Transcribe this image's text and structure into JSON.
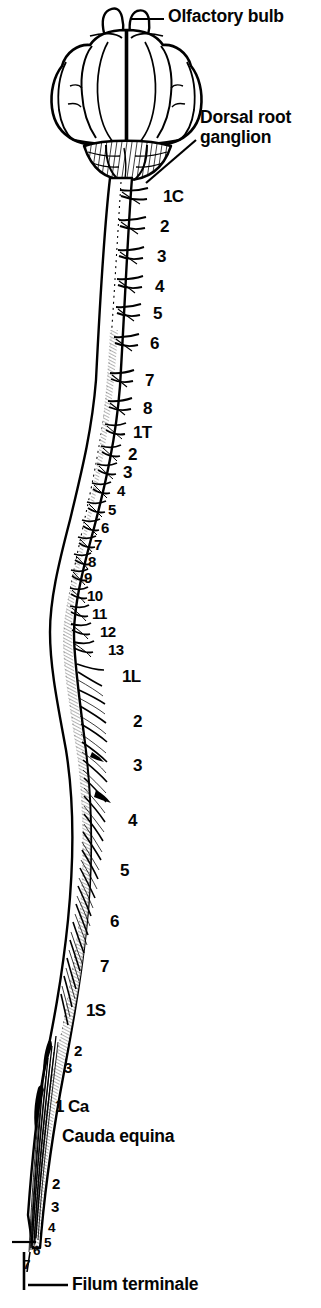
{
  "figure": {
    "background_color": "#ffffff",
    "ink_color": "#000000"
  },
  "callouts": [
    {
      "name": "olfactory-bulb",
      "text": "Olfactory bulb",
      "lines": [
        "Olfactory bulb"
      ],
      "x": 168,
      "y": 8,
      "leader": true
    },
    {
      "name": "dorsal-root-ganglion",
      "text": "Dorsal root ganglion",
      "lines": [
        "Dorsal root",
        "ganglion"
      ],
      "x": 200,
      "y": 108,
      "leader": true
    },
    {
      "name": "cauda-equina",
      "text": "Cauda equina",
      "lines": [
        "Cauda equina"
      ],
      "x": 62,
      "y": 1128,
      "leader": false
    },
    {
      "name": "filum-terminale",
      "text": "Filum terminale",
      "lines": [
        "Filum terminale"
      ],
      "x": 72,
      "y": 1276,
      "leader": true
    }
  ],
  "segments": {
    "cervical": {
      "region": "cervical",
      "region_code": "C",
      "count": 8,
      "labels": [
        "1C",
        "2",
        "3",
        "4",
        "5",
        "6",
        "7",
        "8"
      ],
      "positions": [
        {
          "label": "1C",
          "x": 163,
          "y": 188
        },
        {
          "label": "2",
          "x": 160,
          "y": 218
        },
        {
          "label": "3",
          "x": 157,
          "y": 248
        },
        {
          "label": "4",
          "x": 155,
          "y": 278
        },
        {
          "label": "5",
          "x": 153,
          "y": 305
        },
        {
          "label": "6",
          "x": 150,
          "y": 335
        },
        {
          "label": "7",
          "x": 145,
          "y": 372
        },
        {
          "label": "8",
          "x": 143,
          "y": 400
        }
      ]
    },
    "thoracic": {
      "region": "thoracic",
      "region_code": "T",
      "count": 13,
      "labels": [
        "1T",
        "2",
        "3",
        "4",
        "5",
        "6",
        "7",
        "8",
        "9",
        "10",
        "11",
        "12",
        "13"
      ],
      "positions": [
        {
          "label": "1T",
          "x": 133,
          "y": 424
        },
        {
          "label": "2",
          "x": 128,
          "y": 446
        },
        {
          "label": "3",
          "x": 123,
          "y": 464
        },
        {
          "label": "4",
          "x": 117,
          "y": 483
        },
        {
          "label": "5",
          "x": 108,
          "y": 502
        },
        {
          "label": "6",
          "x": 101,
          "y": 520
        },
        {
          "label": "7",
          "x": 94,
          "y": 537
        },
        {
          "label": "8",
          "x": 88,
          "y": 554
        },
        {
          "label": "9",
          "x": 84,
          "y": 570
        },
        {
          "label": "10",
          "x": 87,
          "y": 588
        },
        {
          "label": "11",
          "x": 92,
          "y": 606
        },
        {
          "label": "12",
          "x": 100,
          "y": 624
        },
        {
          "label": "13",
          "x": 108,
          "y": 642
        }
      ]
    },
    "lumbar": {
      "region": "lumbar",
      "region_code": "L",
      "count": 7,
      "labels": [
        "1L",
        "2",
        "3",
        "4",
        "5",
        "6",
        "7"
      ],
      "positions": [
        {
          "label": "1L",
          "x": 122,
          "y": 668
        },
        {
          "label": "2",
          "x": 133,
          "y": 713
        },
        {
          "label": "3",
          "x": 133,
          "y": 757
        },
        {
          "label": "4",
          "x": 128,
          "y": 812
        },
        {
          "label": "5",
          "x": 120,
          "y": 862
        },
        {
          "label": "6",
          "x": 110,
          "y": 913
        },
        {
          "label": "7",
          "x": 100,
          "y": 958
        }
      ]
    },
    "sacral": {
      "region": "sacral",
      "region_code": "S",
      "count": 3,
      "labels": [
        "1S",
        "2",
        "3"
      ],
      "positions": [
        {
          "label": "1S",
          "x": 86,
          "y": 1002
        },
        {
          "label": "2",
          "x": 74,
          "y": 1043
        },
        {
          "label": "3",
          "x": 64,
          "y": 1060
        }
      ]
    },
    "caudal": {
      "region": "caudal",
      "region_code": "Ca",
      "count": 7,
      "labels": [
        "1 Ca",
        "2",
        "3",
        "4",
        "5",
        "6",
        "7"
      ],
      "positions": [
        {
          "label": "1 Ca",
          "x": 55,
          "y": 1098
        },
        {
          "label": "2",
          "x": 52,
          "y": 1176
        },
        {
          "label": "3",
          "x": 51,
          "y": 1199
        },
        {
          "label": "4",
          "x": 48,
          "y": 1221
        },
        {
          "label": "5",
          "x": 44,
          "y": 1236
        },
        {
          "label": "6",
          "x": 33,
          "y": 1244
        },
        {
          "label": "7",
          "x": 23,
          "y": 1258
        }
      ]
    }
  }
}
